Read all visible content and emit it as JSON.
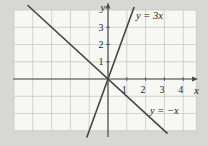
{
  "figure": {
    "background_color": "#d7d7d4",
    "plot_background_color": "#f7f7f4",
    "grid_color": "#c5cac5",
    "axis_color": "#4a4a4a",
    "line_color": "#454545",
    "text_color": "#262626"
  },
  "chart_data": {
    "type": "line",
    "title": "",
    "xlabel": "x",
    "ylabel": "y",
    "grid": true,
    "x_tick_values": [
      1,
      2,
      3,
      4
    ],
    "x_tick_labels": [
      "1",
      "2",
      "3",
      "4"
    ],
    "y_tick_values": [
      1,
      2,
      3
    ],
    "y_tick_labels": [
      "1",
      "2",
      "3"
    ],
    "x_range_shown": [
      -5,
      4.7
    ],
    "y_range_shown": [
      -3,
      4
    ],
    "series": [
      {
        "label": "y = 3x",
        "slope": 3,
        "intercept": 0,
        "x_draw_range": [
          -1.12,
          1.38
        ],
        "label_anchor_px": {
          "x": 136,
          "y": 19
        },
        "sample_points": [
          [
            -1,
            -3
          ],
          [
            0,
            0
          ],
          [
            1,
            3
          ]
        ]
      },
      {
        "label": "y = −x",
        "slope": -1,
        "intercept": 0,
        "x_draw_range": [
          -4.26,
          3.14
        ],
        "label_anchor_px": {
          "x": 150,
          "y": 114
        },
        "sample_points": [
          [
            -4,
            4
          ],
          [
            0,
            0
          ],
          [
            3,
            -3
          ]
        ]
      }
    ]
  }
}
